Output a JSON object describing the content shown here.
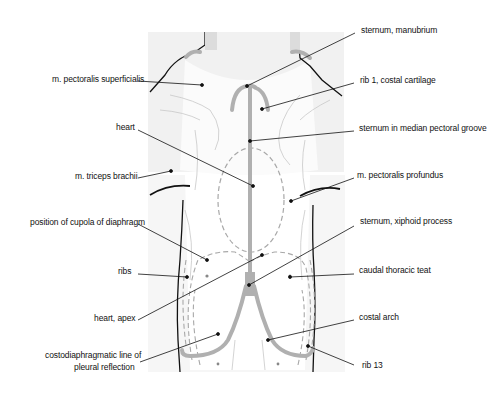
{
  "figure": {
    "labels_left": [
      {
        "id": "pect-sup",
        "text": "m. pectoralis superficialis",
        "x": 52,
        "y": 74
      },
      {
        "id": "heart",
        "text": "heart",
        "x": 116,
        "y": 122
      },
      {
        "id": "triceps",
        "text": "m. triceps brachii",
        "x": 75,
        "y": 171
      },
      {
        "id": "cupola",
        "text": "position of cupola of diaphragm",
        "x": 30,
        "y": 217
      },
      {
        "id": "ribs",
        "text": "ribs",
        "x": 118,
        "y": 266
      },
      {
        "id": "heart-apex",
        "text": "heart, apex",
        "x": 94,
        "y": 313
      },
      {
        "id": "costodiaphragmatic-1",
        "text": "costodiaphragmatic line of",
        "x": 45,
        "y": 350
      },
      {
        "id": "costodiaphragmatic-2",
        "text": "pleural reflection",
        "x": 74,
        "y": 362
      }
    ],
    "labels_right": [
      {
        "id": "manubrium",
        "text": "sternum, manubrium",
        "x": 361,
        "y": 25
      },
      {
        "id": "rib1",
        "text": "rib 1, costal cartilage",
        "x": 360,
        "y": 75
      },
      {
        "id": "sternum-groove",
        "text": "sternum in median pectoral groove",
        "x": 359,
        "y": 123
      },
      {
        "id": "pect-prof",
        "text": "m. pectoralis profundus",
        "x": 357,
        "y": 170
      },
      {
        "id": "xiphoid",
        "text": "sternum, xiphoid process",
        "x": 360,
        "y": 216
      },
      {
        "id": "teat",
        "text": "caudal thoracic teat",
        "x": 359,
        "y": 265
      },
      {
        "id": "costal-arch",
        "text": "costal arch",
        "x": 359,
        "y": 312
      },
      {
        "id": "rib13",
        "text": "rib 13",
        "x": 362,
        "y": 360
      }
    ],
    "colors": {
      "outline": "#111111",
      "bone": "#b0b0b0",
      "dashed": "#a8a8a8",
      "shade": "#ececec",
      "leader": "#111111"
    }
  }
}
